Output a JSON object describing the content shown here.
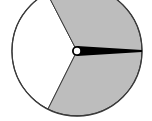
{
  "diagram": {
    "type": "spinner",
    "sectors": [
      {
        "name": "white-sector",
        "fill": "#ffffff",
        "path": "M77,51 L47,-7 A65,65 0 0,0 48,109 Z"
      },
      {
        "name": "gray-sector-upper",
        "fill": "#bdbdbd",
        "path": "M77,51 L47,-7 A65,65 0 0,1 142,51 Z"
      },
      {
        "name": "gray-sector-lower",
        "fill": "#bdbdbd",
        "path": "M77,51 L142,51 A65,65 0 0,1 48,109 Z"
      }
    ],
    "colors": {
      "outline": "#3a3a3a",
      "gray": "#bdbdbd",
      "white": "#ffffff",
      "pointer": "#000000"
    },
    "center": [
      77,
      51
    ],
    "radius": 65,
    "pointer": {
      "points": "77,46 142,50 142,52 77,56"
    }
  }
}
